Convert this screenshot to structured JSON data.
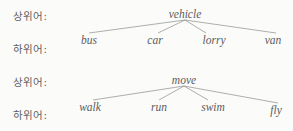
{
  "page": {
    "background_color": "#fbfbfa",
    "text_color": "#5c5c5c",
    "line_color": "#8d8d8d"
  },
  "labels": {
    "hypernym": "상위어:",
    "hyponym": "하위어:"
  },
  "diagrams": [
    {
      "id": "vehicle-tree",
      "root": "vehicle",
      "root_x": 185,
      "root_y": 18,
      "leaf_y": 44,
      "leaves": [
        {
          "text": "bus",
          "x": 89,
          "line_x": 89,
          "baseline_offset": 0
        },
        {
          "text": "car",
          "x": 155,
          "line_x": 158,
          "baseline_offset": 0
        },
        {
          "text": "lorry",
          "x": 214,
          "line_x": 206,
          "baseline_offset": 0
        },
        {
          "text": "van",
          "x": 273,
          "line_x": 276,
          "baseline_offset": 0
        }
      ]
    },
    {
      "id": "move-tree",
      "root": "move",
      "root_x": 184,
      "root_y": 18,
      "leaf_y": 45,
      "leaves": [
        {
          "text": "walk",
          "x": 90,
          "line_x": 93,
          "baseline_offset": 0
        },
        {
          "text": "run",
          "x": 159,
          "line_x": 159,
          "baseline_offset": 0
        },
        {
          "text": "swim",
          "x": 213,
          "line_x": 208,
          "baseline_offset": 0
        },
        {
          "text": "fly",
          "x": 276,
          "line_x": 278,
          "baseline_offset": 3
        }
      ]
    }
  ]
}
